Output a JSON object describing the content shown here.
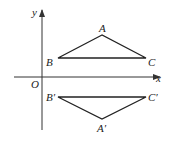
{
  "diagram": {
    "type": "coordinate-reflection",
    "axes": {
      "x_label": "x",
      "y_label": "y",
      "origin_label": "O"
    },
    "triangle_original": {
      "vertices": [
        {
          "name": "A",
          "label": "A"
        },
        {
          "name": "B",
          "label": "B"
        },
        {
          "name": "C",
          "label": "C"
        }
      ]
    },
    "triangle_reflected": {
      "vertices": [
        {
          "name": "A'",
          "label": "A′"
        },
        {
          "name": "B'",
          "label": "B′"
        },
        {
          "name": "C'",
          "label": "C′"
        }
      ]
    },
    "colors": {
      "line": "#222222",
      "axis": "#333333"
    }
  }
}
